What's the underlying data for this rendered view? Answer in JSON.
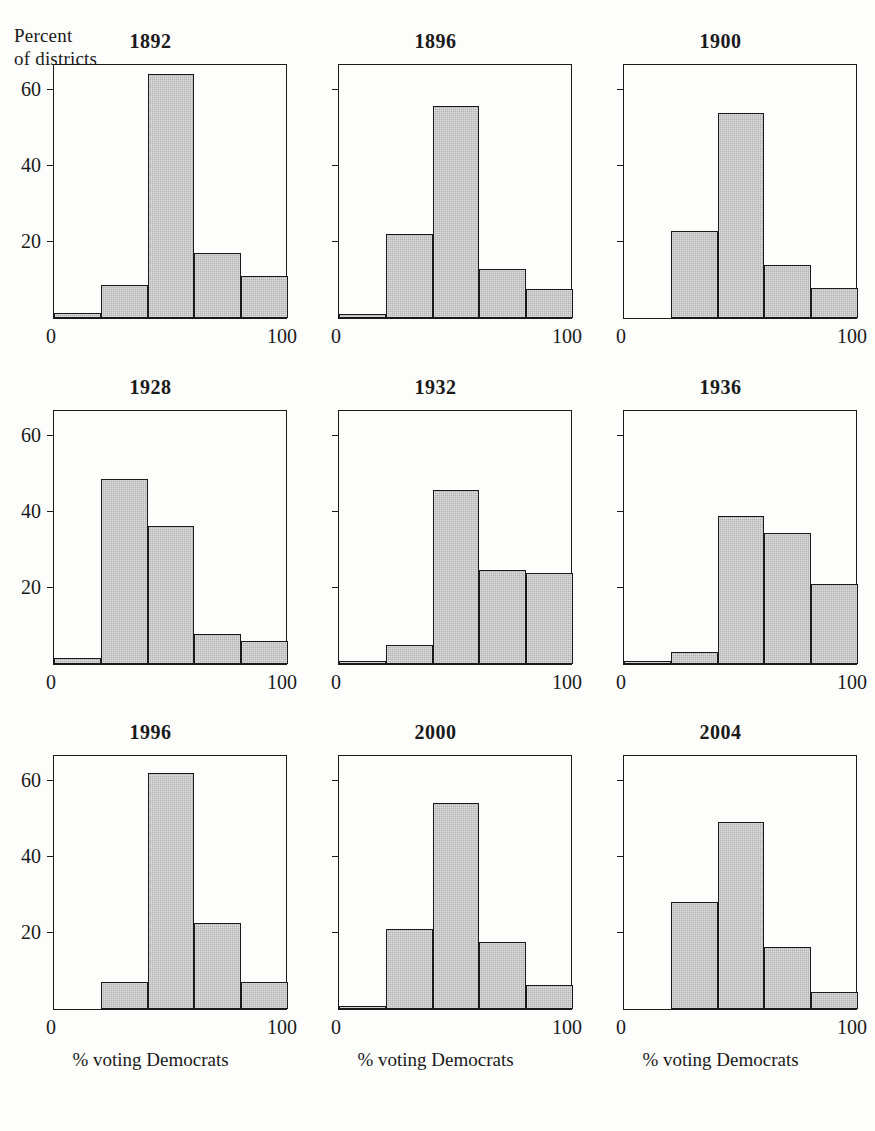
{
  "figure": {
    "y_axis_caption": "Percent\nof districts",
    "x_axis_title": "% voting Democrats",
    "x_tick_left": "0",
    "x_tick_right": "100",
    "y_ticks": [
      "20",
      "40",
      "60"
    ],
    "bar_fill_color": "#b4b4b4",
    "bar_edge_color": "#1a1a1a",
    "background_color": "#fdfdfb"
  },
  "chart_data": {
    "type": "bar",
    "xlabel": "% voting Democrats",
    "ylabel": "Percent of districts",
    "xlim": [
      0,
      100
    ],
    "ylim": [
      0,
      67
    ],
    "grid": false,
    "legend": "none",
    "bin_edges": [
      0,
      20,
      40,
      60,
      80,
      100
    ],
    "categories": [
      "0-20",
      "20-40",
      "40-60",
      "60-80",
      "80-100"
    ],
    "y_tick_values": [
      20,
      40,
      60
    ],
    "x_tick_values": [
      0,
      100
    ],
    "panels": [
      {
        "title": "1892",
        "values": [
          1.2,
          8.8,
          64.2,
          17.0,
          11.0
        ]
      },
      {
        "title": "1896",
        "values": [
          1.0,
          22.0,
          55.8,
          13.0,
          7.5
        ]
      },
      {
        "title": "1900",
        "values": [
          0.0,
          22.8,
          53.8,
          14.0,
          8.0
        ]
      },
      {
        "title": "1928",
        "values": [
          1.5,
          48.5,
          36.2,
          8.0,
          6.0
        ]
      },
      {
        "title": "1932",
        "values": [
          0.6,
          5.0,
          45.8,
          24.8,
          24.0
        ]
      },
      {
        "title": "1936",
        "values": [
          0.6,
          3.2,
          38.8,
          34.5,
          21.0
        ]
      },
      {
        "title": "1996",
        "values": [
          0.0,
          7.0,
          62.0,
          22.5,
          7.0
        ]
      },
      {
        "title": "2000",
        "values": [
          0.6,
          21.0,
          54.0,
          17.5,
          6.2
        ]
      },
      {
        "title": "2004",
        "values": [
          0.0,
          28.0,
          49.2,
          16.2,
          4.5
        ]
      }
    ]
  }
}
